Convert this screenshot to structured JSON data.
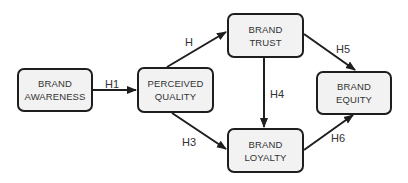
{
  "diagram": {
    "type": "path-model",
    "nodes": [
      {
        "id": "awareness",
        "lines": [
          "BRAND",
          "AWARENESS"
        ]
      },
      {
        "id": "quality",
        "lines": [
          "PERCEIVED",
          "QUALITY"
        ]
      },
      {
        "id": "trust",
        "lines": [
          "BRAND",
          "TRUST"
        ]
      },
      {
        "id": "loyalty",
        "lines": [
          "BRAND",
          "LOYALTY"
        ]
      },
      {
        "id": "equity",
        "lines": [
          "BRAND",
          "EQUITY"
        ]
      }
    ],
    "edges": [
      {
        "from": "awareness",
        "to": "quality",
        "label": "H1"
      },
      {
        "from": "quality",
        "to": "trust",
        "label": "H"
      },
      {
        "from": "quality",
        "to": "loyalty",
        "label": "H3"
      },
      {
        "from": "trust",
        "to": "loyalty",
        "label": "H4"
      },
      {
        "from": "trust",
        "to": "equity",
        "label": "H5"
      },
      {
        "from": "loyalty",
        "to": "equity",
        "label": "H6"
      }
    ],
    "colors": {
      "node_fill": "#f2f2f2",
      "node_border": "#1e1e1e",
      "edge": "#1e1e1e",
      "text": "#333333"
    }
  }
}
